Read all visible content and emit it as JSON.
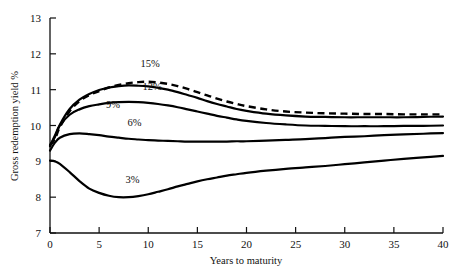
{
  "chart_data": {
    "type": "line",
    "title": "",
    "xlabel": "Years to maturity",
    "ylabel": "Gross redemption yield %",
    "xlim": [
      0,
      40
    ],
    "ylim": [
      7,
      13
    ],
    "xticks": [
      0,
      5,
      10,
      15,
      20,
      25,
      30,
      35,
      40
    ],
    "xtick_labels": [
      "0",
      "5",
      "10",
      "15",
      "20",
      "25",
      "30",
      "35",
      "40"
    ],
    "yticks": [
      7,
      8,
      9,
      10,
      11,
      12,
      13
    ],
    "ytick_labels": [
      "7",
      "8",
      "9",
      "10",
      "11",
      "12",
      "13"
    ],
    "grid": false,
    "legend_position": "inline-annotations",
    "x": [
      0,
      0.5,
      1,
      2,
      3,
      4,
      5,
      6,
      7,
      8,
      9,
      10,
      11,
      12,
      13,
      14,
      15,
      16,
      17,
      18,
      19,
      20,
      22,
      24,
      26,
      28,
      30,
      32,
      34,
      36,
      38,
      40
    ],
    "series": [
      {
        "name": "15%",
        "label": "15%",
        "style": "dashed",
        "color": "#000000",
        "values": [
          9.45,
          9.62,
          9.95,
          10.4,
          10.68,
          10.85,
          10.96,
          11.06,
          11.13,
          11.18,
          11.21,
          11.22,
          11.2,
          11.16,
          11.1,
          11.02,
          10.93,
          10.84,
          10.75,
          10.67,
          10.6,
          10.54,
          10.45,
          10.39,
          10.36,
          10.34,
          10.33,
          10.32,
          10.32,
          10.31,
          10.31,
          10.31
        ]
      },
      {
        "name": "12%",
        "label": "12%",
        "style": "solid",
        "color": "#000000",
        "values": [
          9.45,
          9.68,
          10.02,
          10.46,
          10.72,
          10.88,
          10.99,
          11.06,
          11.1,
          11.12,
          11.11,
          11.09,
          11.05,
          11.0,
          10.93,
          10.85,
          10.77,
          10.68,
          10.6,
          10.53,
          10.46,
          10.41,
          10.33,
          10.28,
          10.25,
          10.24,
          10.23,
          10.23,
          10.23,
          10.23,
          10.24,
          10.25
        ]
      },
      {
        "name": "9%",
        "label": "9%",
        "style": "solid",
        "color": "#000000",
        "values": [
          9.42,
          9.72,
          10.0,
          10.3,
          10.45,
          10.54,
          10.59,
          10.63,
          10.65,
          10.66,
          10.65,
          10.63,
          10.6,
          10.56,
          10.51,
          10.45,
          10.39,
          10.33,
          10.27,
          10.22,
          10.17,
          10.13,
          10.07,
          10.03,
          10.0,
          9.99,
          9.98,
          9.98,
          9.98,
          9.99,
          9.99,
          10.0
        ]
      },
      {
        "name": "6%",
        "label": "6%",
        "style": "solid",
        "color": "#000000",
        "values": [
          9.3,
          9.52,
          9.66,
          9.76,
          9.78,
          9.76,
          9.73,
          9.69,
          9.66,
          9.63,
          9.61,
          9.59,
          9.58,
          9.57,
          9.56,
          9.55,
          9.55,
          9.55,
          9.55,
          9.55,
          9.56,
          9.56,
          9.58,
          9.6,
          9.62,
          9.65,
          9.68,
          9.7,
          9.73,
          9.75,
          9.77,
          9.79
        ]
      },
      {
        "name": "3%",
        "label": "3%",
        "style": "solid",
        "color": "#000000",
        "values": [
          9.02,
          9.0,
          8.93,
          8.7,
          8.45,
          8.24,
          8.12,
          8.04,
          8.0,
          8.0,
          8.03,
          8.08,
          8.15,
          8.22,
          8.3,
          8.37,
          8.44,
          8.5,
          8.55,
          8.6,
          8.64,
          8.68,
          8.74,
          8.79,
          8.83,
          8.87,
          8.92,
          8.97,
          9.02,
          9.07,
          9.11,
          9.15
        ]
      }
    ],
    "annotations": [
      {
        "text": "15%",
        "x": 10.2,
        "y": 11.62
      },
      {
        "text": "12%",
        "x": 10.4,
        "y": 10.98
      },
      {
        "text": "9%",
        "x": 6.4,
        "y": 10.5
      },
      {
        "text": "6%",
        "x": 8.6,
        "y": 10.0
      },
      {
        "text": "3%",
        "x": 8.4,
        "y": 8.4
      }
    ]
  }
}
